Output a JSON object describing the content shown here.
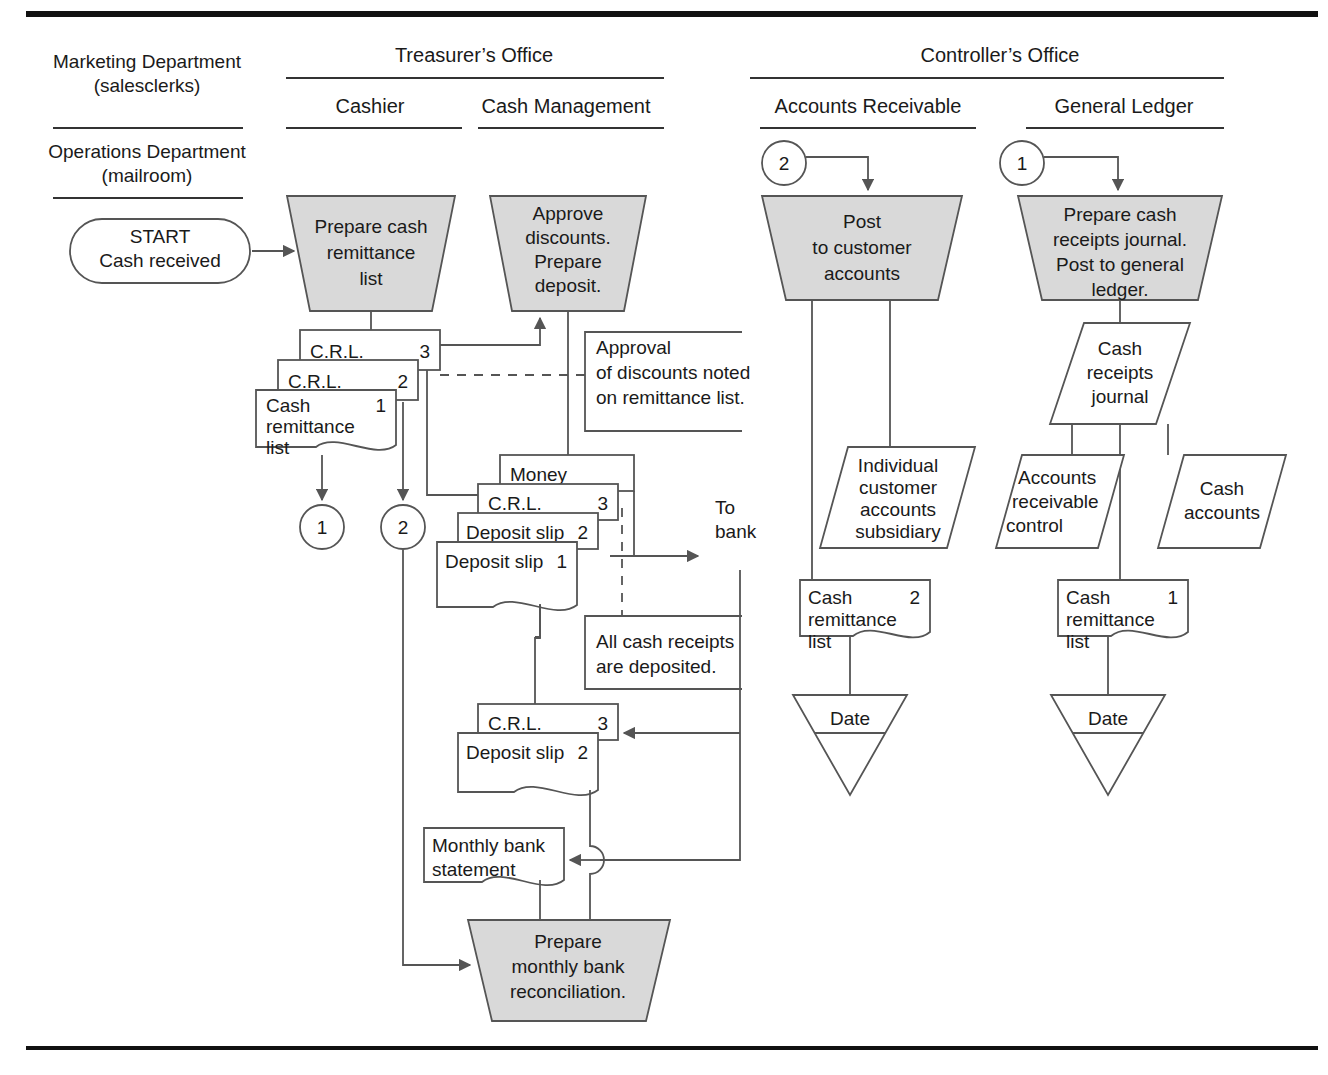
{
  "diagram": {
    "type": "document-flowchart",
    "colors": {
      "process_fill": "#d9d9d9",
      "line": "#555555",
      "text": "#1a1a1a",
      "rule": "#000000"
    },
    "column_headers": {
      "treasurer_office": "Treasurer’s Office",
      "controller_office": "Controller’s Office",
      "marketing_department": "Marketing Department\n(salesclerks)",
      "marketing_department_line1": "Marketing Department",
      "marketing_department_line2": "(salesclerks)",
      "operations_department_line1": "Operations Department",
      "operations_department_line2": "(mailroom)",
      "cashier": "Cashier",
      "cash_management": "Cash Management",
      "accounts_receivable": "Accounts Receivable",
      "general_ledger": "General Ledger"
    },
    "terminator": {
      "line1": "START",
      "line2": "Cash received"
    },
    "processes": [
      {
        "id": "prepare-cash-remittance-list",
        "lines": [
          "Prepare cash",
          "remittance",
          "list"
        ]
      },
      {
        "id": "approve-discounts-prepare-deposit",
        "lines": [
          "Approve",
          "discounts.",
          "Prepare",
          "deposit."
        ]
      },
      {
        "id": "post-to-customer-accounts",
        "lines": [
          "Post",
          "to customer",
          "accounts"
        ]
      },
      {
        "id": "prepare-cash-receipts-journal",
        "lines": [
          "Prepare cash",
          "receipts journal.",
          "Post to general",
          "ledger."
        ]
      },
      {
        "id": "prepare-monthly-bank-reconciliation",
        "lines": [
          "Prepare",
          "monthly bank",
          "reconciliation."
        ]
      }
    ],
    "connectors": [
      {
        "id": "connector-out-1",
        "label": "1"
      },
      {
        "id": "connector-out-2",
        "label": "2"
      },
      {
        "id": "connector-in-2",
        "label": "2"
      },
      {
        "id": "connector-in-1",
        "label": "1"
      }
    ],
    "documents": {
      "crl_stack_top": [
        {
          "title": "C.R.L.",
          "copy": "3"
        },
        {
          "title": "C.R.L.",
          "copy": "2"
        },
        {
          "title_lines": [
            "Cash",
            "remittance",
            "list"
          ],
          "copy": "1"
        }
      ],
      "deposit_stack": [
        {
          "title": "Money",
          "copy": ""
        },
        {
          "title": "C.R.L.",
          "copy": "3"
        },
        {
          "title": "Deposit slip",
          "copy": "2"
        },
        {
          "title": "Deposit slip",
          "copy": "1"
        }
      ],
      "returned_stack": [
        {
          "title": "C.R.L.",
          "copy": "3"
        },
        {
          "title": "Deposit slip",
          "copy": "2"
        }
      ],
      "bank_statement": {
        "lines": [
          "Monthly bank",
          "statement"
        ]
      },
      "ar_remittance": {
        "lines": [
          "Cash",
          "remittance",
          "list"
        ],
        "copy": "2"
      },
      "gl_remittance": {
        "lines": [
          "Cash",
          "remittance",
          "list"
        ],
        "copy": "1"
      }
    },
    "annotations": [
      {
        "id": "approval-note",
        "lines": [
          "Approval",
          "of discounts noted",
          "on remittance list."
        ]
      },
      {
        "id": "deposit-note",
        "lines": [
          "All cash receipts",
          "are deposited."
        ]
      }
    ],
    "offpage_labels": [
      {
        "id": "to-bank",
        "lines": [
          "To",
          "bank"
        ]
      }
    ],
    "ledgers": [
      {
        "id": "individual-customer-accounts-subsidiary",
        "lines": [
          "Individual",
          "customer",
          "accounts",
          "subsidiary"
        ]
      },
      {
        "id": "cash-receipts-journal",
        "lines": [
          "Cash",
          "receipts",
          "journal"
        ]
      },
      {
        "id": "accounts-receivable-control",
        "lines": [
          "Accounts",
          "receivable",
          "control"
        ]
      },
      {
        "id": "cash-accounts",
        "lines": [
          "Cash",
          "accounts"
        ]
      }
    ],
    "files": [
      {
        "id": "file-date-ar",
        "label": "Date"
      },
      {
        "id": "file-date-gl",
        "label": "Date"
      }
    ]
  }
}
